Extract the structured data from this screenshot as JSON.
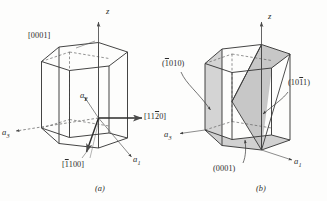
{
  "figure": {
    "background_color": "#fdfdfc",
    "line_color": "#3a3a3a",
    "shade_color": "#c9c9c9",
    "text_color": "#2b2b2b"
  },
  "diagram_a": {
    "caption": "(a)",
    "axis_z": "z",
    "axis_a1": "a",
    "axis_a1_sub": "1",
    "axis_a2": "a",
    "axis_a2_sub": "2",
    "axis_a3": "a",
    "axis_a3_sub": "3",
    "direction_0001": "[0001]",
    "direction_1120_pre": "[11",
    "direction_1120_bar": "2",
    "direction_1120_post": "0]",
    "direction_1100_pre": "[",
    "direction_1100_bar": "1",
    "direction_1100_post": "100]"
  },
  "diagram_b": {
    "caption": "(b)",
    "axis_z": "z",
    "axis_a1": "a",
    "axis_a1_sub": "1",
    "axis_a3": "a",
    "axis_a3_sub": "3",
    "plane_1010_pre": "(",
    "plane_1010_bar": "1",
    "plane_1010_post": "010)",
    "plane_1011_pre": "(10",
    "plane_1011_bar": "1",
    "plane_1011_post": "1)",
    "plane_0001": "(0001)"
  }
}
